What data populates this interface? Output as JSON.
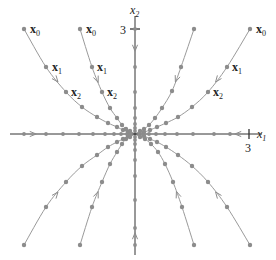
{
  "diagram": {
    "type": "phase-portrait",
    "axes": {
      "x_label": "x",
      "x_label_sub": "1",
      "y_label": "x",
      "y_label_sub": "2",
      "x_tick": "3",
      "y_tick": "3"
    },
    "point_labels": {
      "x0": {
        "main": "x",
        "sub": "0"
      },
      "x1": {
        "main": "x",
        "sub": "1"
      },
      "x2": {
        "main": "x",
        "sub": "2"
      }
    },
    "colors": {
      "curve": "#9a9a9a",
      "dot": "#8c8c8c",
      "axis": "#333333",
      "text": "#222222"
    },
    "trajectories": [
      {
        "name": "upper-left-outer",
        "labeled": true,
        "points": [
          [
            24,
            29
          ],
          [
            46,
            67
          ],
          [
            66,
            92
          ],
          [
            82,
            107
          ],
          [
            97,
            117
          ],
          [
            108,
            123
          ],
          [
            117,
            127
          ],
          [
            123,
            130
          ],
          [
            128,
            132
          ],
          [
            135,
            134
          ]
        ]
      },
      {
        "name": "upper-left-inner",
        "labeled": true,
        "points": [
          [
            80,
            29
          ],
          [
            92,
            67
          ],
          [
            102,
            92
          ],
          [
            110,
            108
          ],
          [
            117,
            118
          ],
          [
            122,
            125
          ],
          [
            126,
            129
          ],
          [
            130,
            131
          ],
          [
            135,
            134
          ]
        ]
      },
      {
        "name": "upper-right-inner",
        "labeled": false,
        "points": [
          [
            194,
            29
          ],
          [
            181,
            67
          ],
          [
            172,
            91
          ],
          [
            162,
            108
          ],
          [
            155,
            118
          ],
          [
            149,
            125
          ],
          [
            144,
            129
          ],
          [
            140,
            131
          ],
          [
            135,
            134
          ]
        ]
      },
      {
        "name": "upper-right-outer",
        "labeled": true,
        "points": [
          [
            250,
            29
          ],
          [
            227,
            67
          ],
          [
            208,
            92
          ],
          [
            192,
            107
          ],
          [
            178,
            117
          ],
          [
            166,
            123
          ],
          [
            157,
            127
          ],
          [
            150,
            130
          ],
          [
            144,
            132
          ],
          [
            135,
            134
          ]
        ]
      },
      {
        "name": "lower-left-outer",
        "labeled": false,
        "points": [
          [
            24,
            245
          ],
          [
            46,
            207
          ],
          [
            66,
            182
          ],
          [
            82,
            166
          ],
          [
            97,
            155
          ],
          [
            108,
            147
          ],
          [
            117,
            142
          ],
          [
            123,
            139
          ],
          [
            128,
            136
          ],
          [
            135,
            134
          ]
        ]
      },
      {
        "name": "lower-left-inner",
        "labeled": false,
        "points": [
          [
            80,
            245
          ],
          [
            92,
            207
          ],
          [
            102,
            182
          ],
          [
            110,
            164
          ],
          [
            117,
            152
          ],
          [
            122,
            144
          ],
          [
            126,
            139
          ],
          [
            130,
            137
          ],
          [
            135,
            134
          ]
        ]
      },
      {
        "name": "lower-right-inner",
        "labeled": false,
        "points": [
          [
            194,
            245
          ],
          [
            182,
            207
          ],
          [
            173,
            182
          ],
          [
            165,
            164
          ],
          [
            158,
            152
          ],
          [
            151,
            144
          ],
          [
            145,
            139
          ],
          [
            140,
            137
          ],
          [
            135,
            134
          ]
        ]
      },
      {
        "name": "lower-right-outer",
        "labeled": false,
        "points": [
          [
            250,
            245
          ],
          [
            227,
            207
          ],
          [
            208,
            182
          ],
          [
            192,
            166
          ],
          [
            178,
            155
          ],
          [
            166,
            147
          ],
          [
            157,
            142
          ],
          [
            150,
            139
          ],
          [
            144,
            136
          ],
          [
            135,
            134
          ]
        ]
      }
    ],
    "label_positions": [
      {
        "traj": 0,
        "x0": [
          30,
          33
        ],
        "x1": [
          52,
          71
        ],
        "x2": [
          71,
          96
        ]
      },
      {
        "traj": 1,
        "x0": [
          86,
          33
        ],
        "x1": [
          97,
          71
        ],
        "x2": [
          107,
          96
        ]
      },
      {
        "traj": 3,
        "x0": [
          256,
          33
        ],
        "x1": [
          232,
          71
        ],
        "x2": [
          213,
          96
        ]
      }
    ],
    "x_axis_dots": [
      24,
      46,
      63,
      79,
      93,
      105,
      114,
      121,
      127,
      131,
      139,
      143,
      149,
      156,
      165,
      177,
      193,
      214,
      230
    ],
    "y_axis_dots": [
      29,
      67,
      92,
      108,
      118,
      124,
      128,
      131,
      137,
      140,
      144,
      150,
      160,
      176,
      200,
      228,
      245
    ]
  }
}
